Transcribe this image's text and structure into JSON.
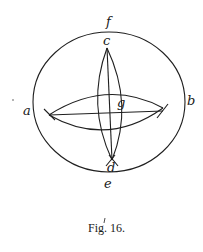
{
  "figure": {
    "caption": "Fig. 16.",
    "labels": {
      "a": "a",
      "b": "b",
      "c": "c",
      "d": "d",
      "e": "e",
      "f": "f",
      "g": "g"
    },
    "colors": {
      "ink": "#1f1f1f",
      "paper": "#ffffff"
    }
  }
}
